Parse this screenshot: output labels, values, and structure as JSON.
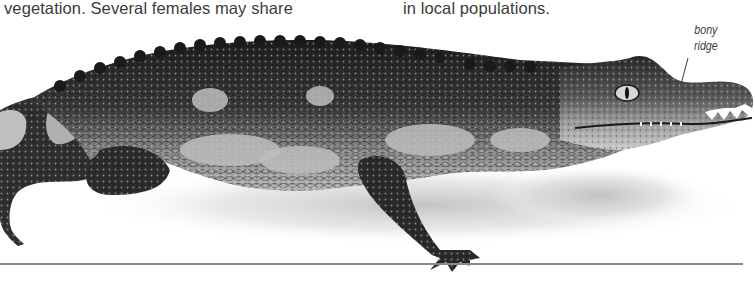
{
  "page": {
    "type": "reference-book-page",
    "body_text": {
      "left_column_line": "vegetation. Several females may share",
      "right_column_line": "in local populations."
    },
    "figure": {
      "subject": "crocodilian (caiman) photograph, grayscale, side view facing right",
      "annotations": [
        {
          "label_line1": "bony",
          "label_line2": "ridge",
          "points_to": "ridge above the eye on the snout"
        }
      ]
    },
    "colors": {
      "text": "#3b3b3b",
      "rule": "#8a8a8a",
      "background": "#ffffff"
    }
  }
}
